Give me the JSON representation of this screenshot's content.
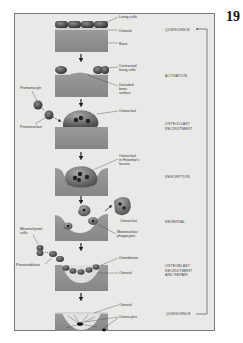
{
  "page": {
    "number": "19"
  },
  "diagram": {
    "stages": [
      {
        "id": "quiescence_top",
        "label": "QUIESCENCE"
      },
      {
        "id": "activation",
        "label": "ACTIVATION"
      },
      {
        "id": "osteoclast_recruitment",
        "label": "OSTEOCLAST RECRUITMENT",
        "lines": [
          "OSTEOCLAST",
          "RECRUITMENT"
        ]
      },
      {
        "id": "resorption",
        "label": "RESORPTION"
      },
      {
        "id": "reversal",
        "label": "REVERSAL"
      },
      {
        "id": "osteoblast_recruitment",
        "label": "OSTEOBLAST RECRUITMENT AND REPAIR",
        "lines": [
          "OSTEOBLAST",
          "RECRUITMENT",
          "AND REPAIR"
        ]
      },
      {
        "id": "quiescence_bottom",
        "label": "QUIESCENCE"
      }
    ],
    "labels": {
      "lining_cells": "Lining cells",
      "osteoid": "Osteoid",
      "bone": "Bone",
      "contracted_lining_cells": [
        "Contracted",
        "lining cells"
      ],
      "denuded_bone_surface": [
        "Denuded",
        "bone",
        "surface"
      ],
      "promonocyte": "Promonocyte",
      "preosteoclast": "Preosteoclast",
      "osteoclast": "Osteoclast",
      "osteoclast_howship": [
        "Osteoclast",
        "in Howship's",
        "lacuna"
      ],
      "osteoclast_reversal": "Osteoclast",
      "mononuclear_phagocytes": [
        "Mononuclear",
        "phagocytes"
      ],
      "mesenchymal_cells": [
        "Mesenchymal",
        "cells"
      ],
      "preosteoblasts": "Preosteoblasts",
      "osteoblasts": "Osteoblasts",
      "osteoid_repair": "Osteoid",
      "osteoid_final": "Osteoid",
      "osteocytes": "Osteocytes"
    }
  },
  "colors": {
    "page_bg": "#ffffff",
    "panel_bg": "#e9e9e7",
    "bone": "#8f8f8d",
    "bone_dark": "#6f6f6d",
    "cell": "#4a4a48",
    "cell_dark": "#222222",
    "osteoid": "#d8d8d6"
  }
}
